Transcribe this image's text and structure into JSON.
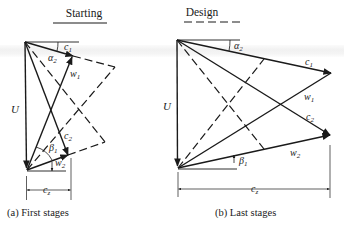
{
  "figure": {
    "legend": {
      "solid": {
        "label": "Starting"
      },
      "dashed": {
        "label": "Design"
      }
    },
    "panels": [
      {
        "id": "a",
        "caption": "(a) First stages",
        "labels": {
          "U": "U",
          "c1": "c",
          "c1_sub": "1",
          "w1": "w",
          "w1_sub": "1",
          "alpha2": "α",
          "alpha2_sub": "2",
          "c2": "c",
          "c2_sub": "2",
          "beta1": "β",
          "beta1_sub": "1",
          "w2": "w",
          "w2_sub": "2",
          "cz": "c",
          "cz_sub": "z"
        }
      },
      {
        "id": "b",
        "caption": "(b) Last stages",
        "labels": {
          "U": "U",
          "c1": "c",
          "c1_sub": "1",
          "w1": "w",
          "w1_sub": "1",
          "alpha2": "α",
          "alpha2_sub": "2",
          "c2": "c",
          "c2_sub": "2",
          "beta1": "β",
          "beta1_sub": "1",
          "w2": "w",
          "w2_sub": "2",
          "cz": "c",
          "cz_sub": "z"
        }
      }
    ],
    "colors": {
      "ink": "#1a1a1a",
      "background": "#ffffff"
    }
  }
}
